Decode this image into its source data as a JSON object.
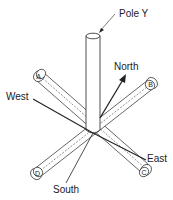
{
  "diagram": {
    "type": "orientation-diagram",
    "pole_label": "Pole Y",
    "directions": {
      "north": "North",
      "south": "South",
      "east": "East",
      "west": "West"
    },
    "rod_labels": {
      "a": "A",
      "b": "B",
      "c": "C",
      "d": "D"
    },
    "colors": {
      "line": "#222222",
      "background": "#ffffff"
    }
  }
}
